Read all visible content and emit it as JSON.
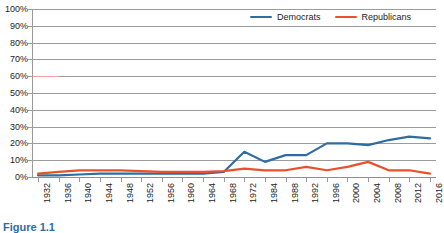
{
  "chart_data": {
    "type": "line",
    "title": "",
    "xlabel": "",
    "ylabel": "",
    "ylim": [
      0,
      100
    ],
    "ytick_labels": [
      "0%",
      "10%",
      "20%",
      "30%",
      "40%",
      "50%",
      "60%",
      "70%",
      "80%",
      "90%",
      "100%"
    ],
    "ytick_values": [
      0,
      10,
      20,
      30,
      40,
      50,
      60,
      70,
      80,
      90,
      100
    ],
    "grid": true,
    "legend_position": "top-right",
    "x": [
      1932,
      1936,
      1940,
      1944,
      1948,
      1952,
      1956,
      1960,
      1964,
      1968,
      1972,
      1984,
      1988,
      1992,
      1996,
      2000,
      2004,
      2008,
      2012,
      2016
    ],
    "xtick_labels": [
      "1932",
      "1936",
      "1940",
      "1944",
      "1948",
      "1952",
      "1956",
      "1960",
      "1964",
      "1968",
      "1972",
      "1984",
      "1988",
      "1992",
      "1996",
      "2000",
      "2004",
      "2008",
      "2012",
      "2016"
    ],
    "series": [
      {
        "name": "Democrats",
        "color": "#2e6da4",
        "values": [
          1,
          1,
          1.5,
          2,
          2,
          2,
          2,
          2,
          2,
          3,
          15,
          9,
          13,
          13,
          20,
          20,
          19,
          22,
          24,
          23
        ]
      },
      {
        "name": "Republicans",
        "color": "#e8512b",
        "values": [
          2,
          3,
          4,
          4,
          4,
          3.5,
          3,
          3,
          3,
          3.5,
          5,
          4,
          4,
          6,
          4,
          6,
          9,
          4,
          4,
          2
        ]
      }
    ]
  },
  "legend": {
    "items": [
      {
        "label": "Democrats",
        "color": "#2e6da4"
      },
      {
        "label": "Republicans",
        "color": "#e8512b"
      }
    ]
  },
  "caption": {
    "text": "Figure 1.1"
  }
}
